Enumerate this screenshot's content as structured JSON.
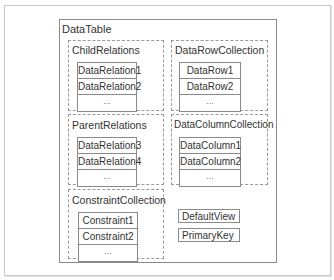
{
  "diagram": {
    "title": "DataTable",
    "groups": [
      {
        "id": "child",
        "label": "ChildRelations",
        "items": [
          "DataRelation1",
          "DataRelation2",
          "..."
        ]
      },
      {
        "id": "rows",
        "label": "DataRowCollection",
        "items": [
          "DataRow1",
          "DataRow2",
          "..."
        ]
      },
      {
        "id": "parent",
        "label": "ParentRelations",
        "items": [
          "DataRelation3",
          "DataRelation4",
          "..."
        ]
      },
      {
        "id": "cols",
        "label": "DataColumnCollection",
        "items": [
          "DataColumn1",
          "DataColumn2",
          "..."
        ]
      },
      {
        "id": "constraints",
        "label": "ConstraintCollection",
        "items": [
          "Constraint1",
          "Constraint2",
          "..."
        ]
      }
    ],
    "properties": [
      "DefaultView",
      "PrimaryKey"
    ]
  },
  "colors": {
    "border": "#8a8a8a",
    "dashed": "#9a9a9a",
    "frame": "#c8c8c8",
    "text": "#333333"
  }
}
